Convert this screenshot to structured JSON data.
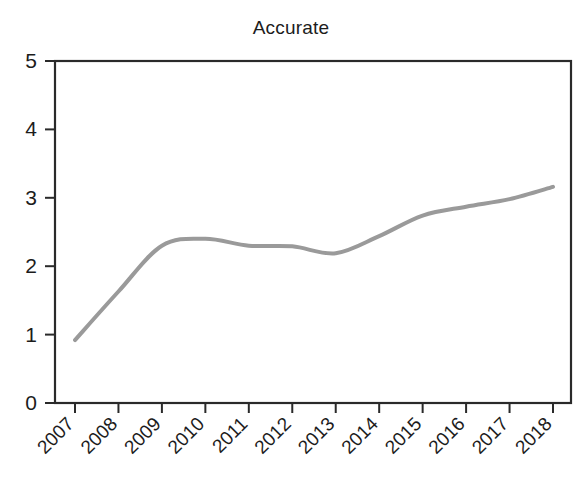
{
  "chart_data": {
    "type": "line",
    "title": "Accurate",
    "xlabel": "",
    "ylabel": "",
    "categories": [
      "2007",
      "2008",
      "2009",
      "2010",
      "2011",
      "2012",
      "2013",
      "2014",
      "2015",
      "2016",
      "2017",
      "2018"
    ],
    "x": [
      2007,
      2008,
      2009,
      2010,
      2011,
      2012,
      2013,
      2014,
      2015,
      2016,
      2017,
      2018
    ],
    "values": [
      0.92,
      1.63,
      2.3,
      2.4,
      2.3,
      2.29,
      2.19,
      2.44,
      2.74,
      2.87,
      2.98,
      3.16
    ],
    "series": [
      {
        "name": "Accurate",
        "values": [
          0.92,
          1.63,
          2.3,
          2.4,
          2.3,
          2.29,
          2.19,
          2.44,
          2.74,
          2.87,
          2.98,
          3.16
        ],
        "color": "#9a9a9a"
      }
    ],
    "ylim": [
      0,
      5
    ],
    "ytick_labels": [
      "0",
      "1",
      "2",
      "3",
      "4",
      "5"
    ],
    "ytick_values": [
      0,
      1,
      2,
      3,
      4,
      5
    ],
    "xtick_labels": [
      "2007",
      "2008",
      "2009",
      "2010",
      "2011",
      "2012",
      "2013",
      "2014",
      "2015",
      "2016",
      "2017",
      "2018"
    ],
    "xtick_label_rotation_deg": 45,
    "grid": false,
    "legend": false,
    "legend_position": "none",
    "line_smoothing": "spline",
    "line_width_px": 4,
    "frame": true,
    "frame_color": "#2a2a2a",
    "background_color": "#ffffff",
    "text_color": "#1c1c1c"
  }
}
